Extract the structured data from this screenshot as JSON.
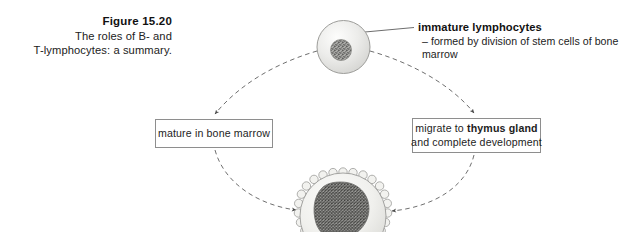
{
  "figure": {
    "caption_title": "Figure 15.20",
    "caption_line1": "The roles of B- and",
    "caption_line2": "T-lymphocytes: a summary."
  },
  "annotations": {
    "immature": {
      "title": "immature lymphocytes",
      "detail": "– formed by division of stem cells of bone marrow"
    }
  },
  "boxes": {
    "bone_marrow": {
      "line1": "mature in bone marrow"
    },
    "thymus": {
      "line1_prefix": "migrate to ",
      "line1_bold": "thymus gland",
      "line2": "and complete development"
    }
  },
  "cells": {
    "immature_lymphocyte": {
      "name": "immature-lymphocyte-cell",
      "body_color": "#e9e9e7",
      "nucleus_color": "#9a9a98"
    },
    "mature_lymphocyte": {
      "name": "mature-lymphocyte-cell",
      "body_color": "#efefec",
      "nucleus_color": "#8a8a88"
    }
  },
  "style": {
    "line_color": "#6e6e6e",
    "box_border": "#8e8e8e",
    "text_color": "#1a1a1a",
    "background": "#ffffff"
  }
}
